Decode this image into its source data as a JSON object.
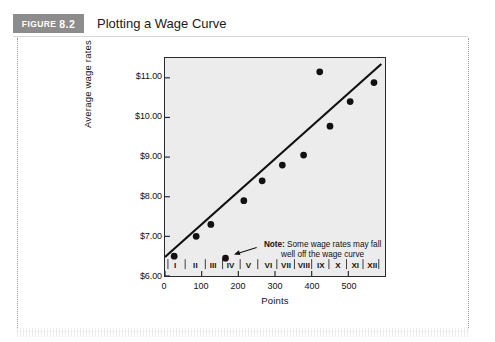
{
  "figure": {
    "tag_word": "FIGURE",
    "tag_number": "8.2",
    "title": "Plotting a Wage Curve"
  },
  "chart_data": {
    "type": "scatter",
    "title": "Plotting a Wage Curve",
    "xlabel": "Points",
    "ylabel": "Average wage rates",
    "xlim": [
      0,
      600
    ],
    "ylim": [
      6.0,
      11.5
    ],
    "grid": false,
    "legend": "none",
    "x_ticks": [
      "0",
      "100",
      "200",
      "300",
      "400",
      "500"
    ],
    "x_tick_values": [
      0,
      100,
      200,
      300,
      400,
      500
    ],
    "y_ticks": [
      "$6.00",
      "$7.00",
      "$8.00",
      "$9.00",
      "$10.00",
      "$11.00"
    ],
    "y_tick_values": [
      6,
      7,
      8,
      9,
      10,
      11
    ],
    "grade_bands": [
      {
        "label": "I",
        "center": 30
      },
      {
        "label": "II",
        "center": 85
      },
      {
        "label": "III",
        "center": 133
      },
      {
        "label": "IV",
        "center": 180
      },
      {
        "label": "V",
        "center": 228
      },
      {
        "label": "VI",
        "center": 282
      },
      {
        "label": "VII",
        "center": 330
      },
      {
        "label": "VIII",
        "center": 378
      },
      {
        "label": "IX",
        "center": 424
      },
      {
        "label": "X",
        "center": 470
      },
      {
        "label": "XI",
        "center": 517
      },
      {
        "label": "XII",
        "center": 563
      }
    ],
    "grade_band_edges": [
      8,
      55,
      110,
      157,
      205,
      253,
      305,
      353,
      400,
      447,
      495,
      540,
      583
    ],
    "series": [
      {
        "name": "Average wage rates",
        "marker": "filled-circle",
        "color": "#111111",
        "points": [
          {
            "x": 25,
            "y": 6.5
          },
          {
            "x": 85,
            "y": 7.0
          },
          {
            "x": 125,
            "y": 7.3
          },
          {
            "x": 165,
            "y": 6.45
          },
          {
            "x": 215,
            "y": 7.9
          },
          {
            "x": 265,
            "y": 8.4
          },
          {
            "x": 320,
            "y": 8.8
          },
          {
            "x": 378,
            "y": 9.05
          },
          {
            "x": 422,
            "y": 11.15
          },
          {
            "x": 450,
            "y": 9.78
          },
          {
            "x": 505,
            "y": 10.4
          },
          {
            "x": 570,
            "y": 10.88
          }
        ]
      }
    ],
    "trend_line": {
      "name": "wage curve",
      "color": "#111111",
      "x_start": 0,
      "y_start": 6.48,
      "x_end": 590,
      "y_end": 11.35
    },
    "annotations": [
      {
        "name": "note",
        "bold_prefix": "Note:",
        "line1": " Some wage rates may fall",
        "line2": "well off the wage curve",
        "arrow_from_x": 250,
        "arrow_from_y": 6.72,
        "arrow_to_x": 180,
        "arrow_to_y": 6.52
      }
    ]
  },
  "colors": {
    "tag_background": "#8c8c8c",
    "plot_background": "#ececed",
    "axis": "#2b2b2b",
    "marker": "#111111"
  }
}
